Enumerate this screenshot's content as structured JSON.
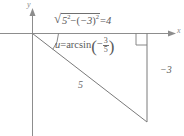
{
  "figure": {
    "kind": "reference-triangle-diagram",
    "background_color": "#ffffff",
    "stroke_color": "#7a7a7a",
    "text_color": "#5a5a5a"
  },
  "axes": {
    "y_label": "y",
    "x_label": "x",
    "origin": {
      "x": 32,
      "y": 33
    }
  },
  "labels": {
    "adjacent_expression": {
      "radical_glyph": "√",
      "base": "5",
      "base_exponent": "2",
      "minus": "−",
      "term_open": "(",
      "term_value": "−3",
      "term_close": ")",
      "term_exponent": "2",
      "equals": "=",
      "result": "4",
      "plain": "√(5² − (−3)²) = 4"
    },
    "angle_expression": {
      "variable": "u",
      "equals": "=",
      "function": "arcsin",
      "open_paren": "(",
      "sign": "−",
      "numerator": "3",
      "denominator": "5",
      "close_paren": ")",
      "plain": "u = arcsin(−3/5)"
    },
    "hypotenuse": "5",
    "opposite": "−3"
  },
  "geometry": {
    "x_axis": {
      "x1": 0,
      "y1": 33,
      "x2": 171,
      "y2": 33
    },
    "y_axis": {
      "x1": 32,
      "y1": 18,
      "x2": 32,
      "y2": 136
    },
    "hypotenuse": {
      "x1": 32,
      "y1": 33,
      "x2": 147,
      "y2": 122
    },
    "opposite_side": {
      "x1": 147,
      "y1": 33,
      "x2": 147,
      "y2": 122
    },
    "angle_arc": {
      "cx": 32,
      "cy": 33,
      "radius": 26
    },
    "right_angle_box": {
      "x": 136,
      "y": 33,
      "size": 11
    }
  }
}
